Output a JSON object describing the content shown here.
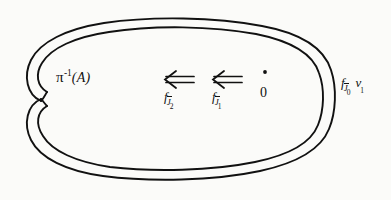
{
  "figure": {
    "kind": "hand-drawn-mathematical-diagram",
    "background_color": "#fbfbf9",
    "ink_color": "#111111"
  },
  "labels": {
    "preimage": {
      "pi": "π",
      "exponent": "-1",
      "argument": "(A)",
      "full_text": "π⁻¹(A)"
    },
    "arrow_map_2": {
      "base": "f",
      "subscript_letter": "J",
      "subscript_index": "2",
      "full_text": "f_J̅2"
    },
    "arrow_map_1": {
      "base": "f",
      "subscript_letter": "J",
      "subscript_index": "1",
      "full_text": "f_J̅1"
    },
    "origin_point": {
      "dot": "•",
      "text": "0"
    },
    "outer_right": {
      "base": "f",
      "subscript_letter": "J",
      "subscript_index": "0",
      "vector": "v",
      "vector_index": "1",
      "full_text": "f_J̅0 v₁"
    }
  },
  "arrows": {
    "symbol": "⇐",
    "count": 2,
    "direction": "leftward-double"
  }
}
